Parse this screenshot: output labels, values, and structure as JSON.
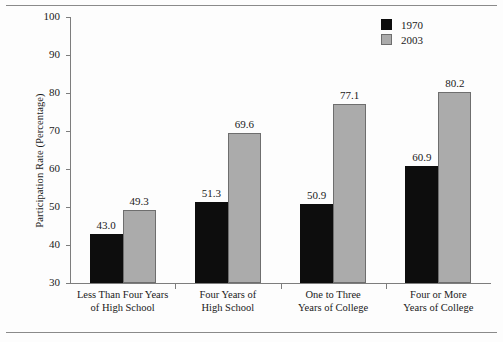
{
  "chart_data": {
    "type": "bar",
    "title": "",
    "xlabel": "",
    "ylabel": "Participation Rate (Percentage)",
    "ylim": [
      30,
      100
    ],
    "yticks": [
      30,
      40,
      50,
      60,
      70,
      80,
      90,
      100
    ],
    "ytick_labels": [
      "30",
      "40",
      "50",
      "60",
      "70",
      "80",
      "90",
      "100"
    ],
    "grid": false,
    "legend_position": "top-right",
    "categories": [
      "Less Than Four Years\nof High School",
      "Four Years of\nHigh School",
      "One to Three\nYears of College",
      "Four or More\nYears of College"
    ],
    "category_lines": [
      [
        "Less Than Four Years",
        "of High School"
      ],
      [
        "Four Years of",
        "High School"
      ],
      [
        "One to Three",
        "Years of College"
      ],
      [
        "Four or More",
        "Years of College"
      ]
    ],
    "series": [
      {
        "name": "1970",
        "color": "#0d0d0d",
        "values": [
          43.0,
          51.3,
          50.9,
          60.9
        ],
        "labels": [
          "43.0",
          "51.3",
          "50.9",
          "60.9"
        ]
      },
      {
        "name": "2003",
        "color": "#ababab",
        "values": [
          49.3,
          69.6,
          77.1,
          80.2
        ],
        "labels": [
          "49.3",
          "69.6",
          "77.1",
          "80.2"
        ]
      }
    ]
  },
  "legend": {
    "items": [
      {
        "label": "1970",
        "swatch": "black-square-swatch"
      },
      {
        "label": "2003",
        "swatch": "gray-square-swatch"
      }
    ]
  },
  "axes": {
    "y_title": "Participation Rate (Percentage)"
  }
}
